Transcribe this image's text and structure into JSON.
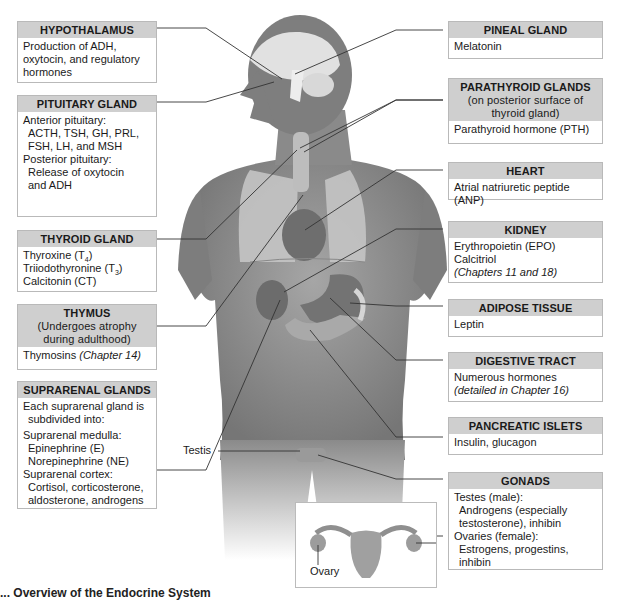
{
  "figure": {
    "caption_partial": "... Overview of the Endocrine System"
  },
  "left_boxes": [
    {
      "title": "HYPOTHALAMUS",
      "lines": [
        "Production of ADH,",
        "oxytocin, and regulatory",
        "hormones"
      ]
    },
    {
      "title": "PITUITARY GLAND",
      "lines": [
        "Anterior pituitary:",
        "ACTH, TSH, GH, PRL,",
        "FSH, LH, and MSH",
        "Posterior pituitary:",
        "Release of oxytocin",
        "and ADH"
      ]
    },
    {
      "title": "THYROID GLAND",
      "lines": [
        "Thyroxine (T",
        "4",
        ")",
        "Triiodothyronine (T",
        "3",
        ")",
        "Calcitonin (CT)"
      ]
    },
    {
      "title": "THYMUS",
      "subtitle": [
        "(Undergoes atrophy",
        "during adulthood)"
      ],
      "lines": [
        "Thymosins ",
        "(Chapter 14)"
      ]
    },
    {
      "title": "SUPRARENAL GLANDS",
      "lines": [
        "Each suprarenal gland is",
        "subdivided into:",
        "Suprarenal medulla:",
        "Epinephrine (E)",
        "Norepinephrine (NE)",
        "Suprarenal cortex:",
        "Cortisol, corticosterone,",
        "aldosterone, androgens"
      ]
    }
  ],
  "right_boxes": [
    {
      "title": "PINEAL GLAND",
      "lines": [
        "Melatonin"
      ]
    },
    {
      "title": "PARATHYROID GLANDS",
      "subtitle": [
        "(on posterior surface of",
        "thyroid gland)"
      ],
      "lines": [
        "Parathyroid hormone (PTH)"
      ]
    },
    {
      "title": "HEART",
      "lines": [
        "Atrial natriuretic peptide (ANP)"
      ]
    },
    {
      "title": "KIDNEY",
      "lines": [
        "Erythropoietin (EPO)",
        "Calcitriol",
        "(Chapters 11 and 18)"
      ]
    },
    {
      "title": "ADIPOSE TISSUE",
      "lines": [
        "Leptin"
      ]
    },
    {
      "title": "DIGESTIVE TRACT",
      "lines": [
        "Numerous hormones",
        "(detailed in Chapter 16)"
      ]
    },
    {
      "title": "PANCREATIC ISLETS",
      "lines": [
        "Insulin, glucagon"
      ]
    },
    {
      "title": "GONADS",
      "lines": [
        "Testes (male):",
        "Androgens (especially",
        "testosterone), inhibin",
        "Ovaries (female):",
        "Estrogens, progestins,",
        "inhibin"
      ]
    }
  ],
  "labels": {
    "testis": "Testis",
    "ovary": "Ovary"
  },
  "colors": {
    "header_bg": "#cfcfcf",
    "border": "#b9b9b9",
    "skin": "#8e8e8e",
    "leader_line": "#333333"
  }
}
